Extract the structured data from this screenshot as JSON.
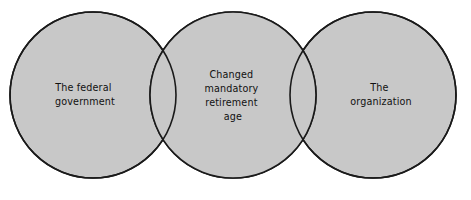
{
  "figure": {
    "type": "venn-diagram-3-circle-chain",
    "background_color": "#ffffff",
    "circle_fill": "#c8c8c8",
    "circle_stroke": "#1a1a1a",
    "text_color": "#111111"
  },
  "circles": [
    {
      "id": "left",
      "name": "federal-government-circle",
      "cx": 93,
      "cy": 95,
      "r": 83,
      "label_lines": [
        "The federal",
        "government"
      ],
      "label_x": 85,
      "label_y": 91
    },
    {
      "id": "middle",
      "name": "changed-mandatory-retirement-age-circle",
      "cx": 233,
      "cy": 95,
      "r": 83,
      "label_lines": [
        "Changed",
        "mandatory",
        "retirement",
        "age"
      ],
      "label_x": 233,
      "label_y": 78
    },
    {
      "id": "right",
      "name": "organization-circle",
      "cx": 373,
      "cy": 95,
      "r": 83,
      "label_lines": [
        "The",
        "organization"
      ],
      "label_x": 381,
      "label_y": 91
    }
  ],
  "labels": {
    "left_line_1": "The federal",
    "left_line_2": "government",
    "middle_line_1": "Changed",
    "middle_line_2": "mandatory",
    "middle_line_3": "retirement",
    "middle_line_4": "age",
    "right_line_1": "The",
    "right_line_2": "organization"
  },
  "caption": {
    "cropped_text": ""
  }
}
